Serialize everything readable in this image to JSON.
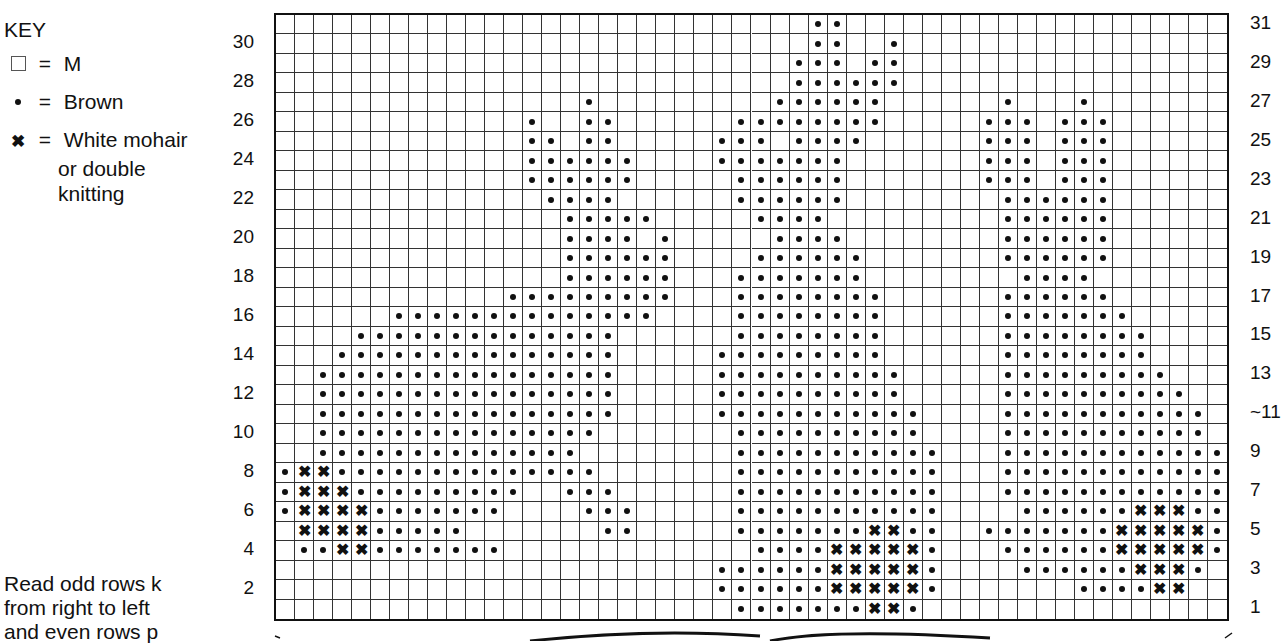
{
  "key": {
    "title": "KEY",
    "items": [
      {
        "symbol": "empty-square",
        "eq": "=",
        "label": "M"
      },
      {
        "symbol": "dot",
        "eq": "=",
        "label": "Brown"
      },
      {
        "symbol": "cross",
        "eq": "=",
        "label": "White mohair",
        "label_cont": [
          "or double",
          "knitting"
        ]
      }
    ]
  },
  "instructions": [
    "Read odd rows k",
    "from right to left",
    "and even rows p"
  ],
  "chart": {
    "columns": 50,
    "rows": 31,
    "left_labels": [
      "30",
      "28",
      "26",
      "24",
      "22",
      "20",
      "18",
      "16",
      "14",
      "12",
      "10",
      "8",
      "6",
      "4",
      "2"
    ],
    "right_labels": [
      "31",
      "29",
      "27",
      "25",
      "23",
      "21",
      "19",
      "17",
      "15",
      "13",
      "~11",
      "9",
      "7",
      "5",
      "3",
      "1"
    ],
    "legend": {
      "o": "Brown",
      "x": "White mohair or double knitting",
      ".": "M"
    },
    "pattern_rows_top_to_bottom": {
      "31": {
        "o": [
          [
            28,
            29
          ]
        ]
      },
      "30": {
        "o": [
          [
            28,
            29
          ],
          [
            32,
            32
          ]
        ]
      },
      "29": {
        "o": [
          [
            27,
            29
          ],
          [
            31,
            32
          ]
        ]
      },
      "28": {
        "o": [
          [
            27,
            32
          ]
        ]
      },
      "27": {
        "o": [
          [
            16,
            16
          ],
          [
            26,
            31
          ],
          [
            38,
            38
          ],
          [
            42,
            42
          ]
        ]
      },
      "26": {
        "o": [
          [
            13,
            13
          ],
          [
            16,
            17
          ],
          [
            24,
            31
          ],
          [
            37,
            39
          ],
          [
            41,
            43
          ]
        ]
      },
      "25": {
        "o": [
          [
            13,
            14
          ],
          [
            16,
            17
          ],
          [
            23,
            25
          ],
          [
            27,
            30
          ],
          [
            37,
            39
          ],
          [
            41,
            43
          ]
        ]
      },
      "24": {
        "o": [
          [
            13,
            18
          ],
          [
            23,
            29
          ],
          [
            37,
            39
          ],
          [
            41,
            43
          ]
        ]
      },
      "23": {
        "o": [
          [
            13,
            18
          ],
          [
            24,
            29
          ],
          [
            37,
            39
          ],
          [
            41,
            43
          ]
        ]
      },
      "22": {
        "o": [
          [
            14,
            17
          ],
          [
            24,
            29
          ],
          [
            38,
            43
          ]
        ]
      },
      "21": {
        "o": [
          [
            15,
            19
          ],
          [
            25,
            28
          ],
          [
            38,
            43
          ]
        ]
      },
      "20": {
        "o": [
          [
            15,
            18
          ],
          [
            20,
            20
          ],
          [
            26,
            29
          ],
          [
            38,
            43
          ]
        ]
      },
      "19": {
        "o": [
          [
            15,
            20
          ],
          [
            25,
            30
          ],
          [
            38,
            43
          ]
        ]
      },
      "18": {
        "o": [
          [
            15,
            20
          ],
          [
            24,
            30
          ],
          [
            39,
            42
          ]
        ]
      },
      "17": {
        "o": [
          [
            12,
            20
          ],
          [
            24,
            31
          ],
          [
            38,
            43
          ]
        ]
      },
      "16": {
        "o": [
          [
            6,
            19
          ],
          [
            24,
            31
          ],
          [
            38,
            44
          ]
        ]
      },
      "15": {
        "o": [
          [
            4,
            17
          ],
          [
            24,
            31
          ],
          [
            38,
            45
          ]
        ]
      },
      "14": {
        "o": [
          [
            3,
            17
          ],
          [
            23,
            31
          ],
          [
            38,
            45
          ]
        ]
      },
      "13": {
        "o": [
          [
            2,
            17
          ],
          [
            23,
            32
          ],
          [
            38,
            46
          ]
        ]
      },
      "12": {
        "o": [
          [
            2,
            17
          ],
          [
            23,
            32
          ],
          [
            38,
            47
          ]
        ]
      },
      "11": {
        "o": [
          [
            2,
            17
          ],
          [
            23,
            33
          ],
          [
            38,
            48
          ]
        ]
      },
      "10": {
        "o": [
          [
            2,
            16
          ],
          [
            24,
            33
          ],
          [
            38,
            48
          ]
        ]
      },
      "9": {
        "o": [
          [
            2,
            15
          ],
          [
            24,
            34
          ],
          [
            38,
            49
          ]
        ]
      },
      "8": {
        "o": [
          [
            0,
            0
          ],
          [
            3,
            16
          ],
          [
            24,
            34
          ],
          [
            38,
            49
          ]
        ],
        "x": [
          [
            1,
            2
          ]
        ]
      },
      "7": {
        "o": [
          [
            0,
            0
          ],
          [
            4,
            12
          ],
          [
            15,
            17
          ],
          [
            24,
            34
          ],
          [
            38,
            49
          ]
        ],
        "x": [
          [
            1,
            3
          ]
        ]
      },
      "6": {
        "o": [
          [
            0,
            0
          ],
          [
            5,
            11
          ],
          [
            16,
            18
          ],
          [
            24,
            34
          ],
          [
            39,
            44
          ],
          [
            48,
            49
          ]
        ],
        "x": [
          [
            1,
            4
          ],
          [
            45,
            47
          ]
        ]
      },
      "5": {
        "o": [
          [
            5,
            9
          ],
          [
            17,
            18
          ],
          [
            24,
            30
          ],
          [
            33,
            34
          ],
          [
            37,
            43
          ],
          [
            49,
            49
          ]
        ],
        "x": [
          [
            1,
            4
          ],
          [
            31,
            32
          ],
          [
            44,
            48
          ]
        ]
      },
      "4": {
        "o": [
          [
            1,
            2
          ],
          [
            5,
            11
          ],
          [
            25,
            28
          ],
          [
            34,
            34
          ],
          [
            38,
            43
          ],
          [
            49,
            49
          ]
        ],
        "x": [
          [
            3,
            4
          ],
          [
            29,
            33
          ],
          [
            44,
            48
          ]
        ]
      },
      "3": {
        "o": [
          [
            23,
            28
          ],
          [
            34,
            34
          ],
          [
            39,
            44
          ],
          [
            48,
            48
          ]
        ],
        "x": [
          [
            29,
            33
          ],
          [
            45,
            47
          ]
        ]
      },
      "2": {
        "o": [
          [
            23,
            28
          ],
          [
            34,
            34
          ],
          [
            42,
            45
          ]
        ],
        "x": [
          [
            29,
            33
          ],
          [
            46,
            47
          ]
        ]
      },
      "1": {
        "o": [
          [
            24,
            30
          ],
          [
            33,
            33
          ]
        ],
        "x": [
          [
            31,
            32
          ]
        ]
      }
    }
  }
}
